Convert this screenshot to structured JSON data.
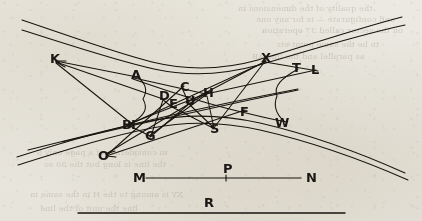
{
  "figure": {
    "ink_color": "#17140f",
    "paper_color": "#e9e7df",
    "width": 422,
    "height": 221
  },
  "labels": [
    {
      "text": "K",
      "x": 50,
      "y": 63,
      "size": 13
    },
    {
      "text": "A",
      "x": 131,
      "y": 79,
      "size": 13
    },
    {
      "text": "C",
      "x": 180,
      "y": 91,
      "size": 13
    },
    {
      "text": "D",
      "x": 159,
      "y": 100,
      "size": 13
    },
    {
      "text": "E",
      "x": 169,
      "y": 108,
      "size": 13
    },
    {
      "text": "U",
      "x": 185,
      "y": 105,
      "size": 13
    },
    {
      "text": "H",
      "x": 203,
      "y": 97,
      "size": 13
    },
    {
      "text": "X",
      "x": 261,
      "y": 62,
      "size": 13
    },
    {
      "text": "T",
      "x": 292,
      "y": 72,
      "size": 13
    },
    {
      "text": "L",
      "x": 311,
      "y": 74,
      "size": 13
    },
    {
      "text": "F",
      "x": 240,
      "y": 116,
      "size": 13
    },
    {
      "text": "W",
      "x": 275,
      "y": 127,
      "size": 13
    },
    {
      "text": "B",
      "x": 122,
      "y": 129,
      "size": 13
    },
    {
      "text": "I",
      "x": 131,
      "y": 129,
      "size": 13
    },
    {
      "text": "G",
      "x": 145,
      "y": 140,
      "size": 13
    },
    {
      "text": "S",
      "x": 210,
      "y": 133,
      "size": 13
    },
    {
      "text": "O",
      "x": 98,
      "y": 160,
      "size": 13
    },
    {
      "text": "M",
      "x": 133,
      "y": 182,
      "size": 13
    },
    {
      "text": "P",
      "x": 223,
      "y": 173,
      "size": 13
    },
    {
      "text": "N",
      "x": 306,
      "y": 182,
      "size": 13
    },
    {
      "text": "R",
      "x": 204,
      "y": 207,
      "size": 13
    }
  ],
  "segments": {
    "mn_line": {
      "x1": 146,
      "y1": 178,
      "x2": 301,
      "y2": 178
    },
    "p_tick": {
      "x1": 226,
      "y1": 175,
      "x2": 226,
      "y2": 181
    },
    "r_line": {
      "x1": 78,
      "y1": 213,
      "x2": 345,
      "y2": 213
    }
  },
  "bleed_text": [
    {
      "text": "the quality of the dimensions in",
      "x": 238,
      "y": 4,
      "size": 8
    },
    {
      "text": "and configurate — is for any one",
      "x": 256,
      "y": 15,
      "size": 8
    },
    {
      "text": "on the sector called 37 operation",
      "x": 262,
      "y": 26,
      "size": 8
    },
    {
      "text": "to be the same point etc",
      "x": 276,
      "y": 40,
      "size": 8
    },
    {
      "text": "as parallel and the line AB",
      "x": 252,
      "y": 52,
      "size": 8
    },
    {
      "text": "in considerate of a page only S",
      "x": 36,
      "y": 148,
      "size": 8
    },
    {
      "text": "the line is long but the 30 so",
      "x": 44,
      "y": 160,
      "size": 8
    },
    {
      "text": "XY is among to the H in the same in",
      "x": 30,
      "y": 190,
      "size": 8
    },
    {
      "text": "line the unit of the line",
      "x": 40,
      "y": 204,
      "size": 8
    }
  ]
}
